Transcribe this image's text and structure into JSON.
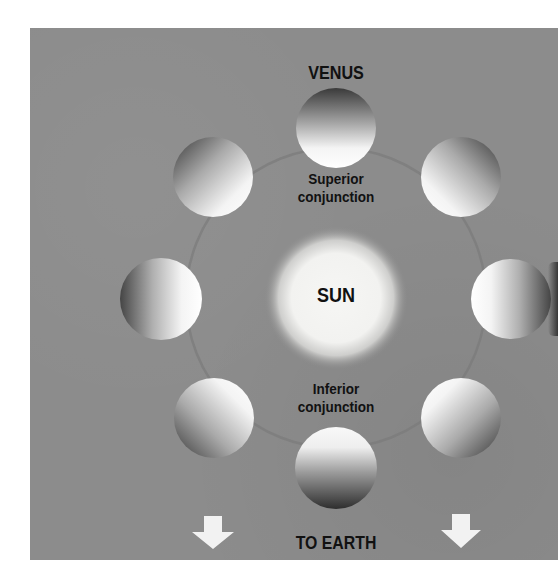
{
  "figure": {
    "title": "VENUS",
    "center_label": "SUN",
    "top_label": [
      "Superior",
      "conjunction"
    ],
    "bottom_label": [
      "Inferior",
      "conjunction"
    ],
    "direction_label": "TO EARTH",
    "direction_icons": [
      "arrow-down-icon",
      "arrow-down-icon"
    ]
  },
  "colors": {
    "background": "#ffffff",
    "panel": "#8c8c8c",
    "sun": "#f4f4f2",
    "text": "#111111",
    "arrow": "#f2f2f2"
  },
  "orbit": {
    "center": [
      336,
      298
    ],
    "radius": 150
  },
  "planets": [
    {
      "name": "venus-top",
      "cx": 336,
      "cy": 128,
      "lit_direction": "bottom"
    },
    {
      "name": "venus-upper-right",
      "cx": 461,
      "cy": 177,
      "lit_direction": "lower-left"
    },
    {
      "name": "venus-right",
      "cx": 511,
      "cy": 299,
      "lit_direction": "left"
    },
    {
      "name": "venus-lower-right",
      "cx": 461,
      "cy": 418,
      "lit_direction": "upper-left"
    },
    {
      "name": "venus-bottom",
      "cx": 336,
      "cy": 468,
      "lit_direction": "top"
    },
    {
      "name": "venus-lower-left",
      "cx": 214,
      "cy": 418,
      "lit_direction": "upper-right"
    },
    {
      "name": "venus-left",
      "cx": 161,
      "cy": 299,
      "lit_direction": "right"
    },
    {
      "name": "venus-upper-left",
      "cx": 213,
      "cy": 177,
      "lit_direction": "lower-right"
    }
  ]
}
